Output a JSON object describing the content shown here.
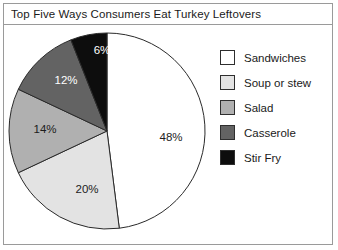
{
  "title": "Top Five Ways Consumers Eat Turkey Leftovers",
  "chart_data": {
    "type": "pie",
    "title": "Top Five Ways Consumers Eat Turkey Leftovers",
    "categories": [
      "Sandwiches",
      "Soup or stew",
      "Salad",
      "Casserole",
      "Stir Fry"
    ],
    "values": [
      48,
      20,
      14,
      12,
      6
    ],
    "value_labels": [
      "48%",
      "20%",
      "14%",
      "12%",
      "6%"
    ],
    "unit": "%",
    "colors": [
      "#ffffff",
      "#e3e3e3",
      "#b0b0b0",
      "#636363",
      "#0d0d0d"
    ],
    "label_text_colors": [
      "#1c1c1c",
      "#1c1c1c",
      "#1c1c1c",
      "#ffffff",
      "#ffffff"
    ],
    "start_angle_deg": 0,
    "direction": "clockwise",
    "legend_position": "right",
    "grid": false,
    "xlabel": "",
    "ylabel": ""
  },
  "legend": {
    "items": [
      {
        "label": "Sandwiches",
        "color": "#ffffff"
      },
      {
        "label": "Soup or stew",
        "color": "#e3e3e3"
      },
      {
        "label": "Salad",
        "color": "#b0b0b0"
      },
      {
        "label": "Casserole",
        "color": "#636363"
      },
      {
        "label": "Stir Fry",
        "color": "#0d0d0d"
      }
    ]
  },
  "slice_labels": [
    {
      "text": "48%",
      "x": 167,
      "y": 111,
      "tone": "dark"
    },
    {
      "text": "20%",
      "x": 83,
      "y": 163,
      "tone": "dark"
    },
    {
      "text": "14%",
      "x": 41,
      "y": 103,
      "tone": "dark"
    },
    {
      "text": "12%",
      "x": 62,
      "y": 54,
      "tone": "light"
    },
    {
      "text": "6%",
      "x": 98,
      "y": 24,
      "tone": "light"
    }
  ]
}
